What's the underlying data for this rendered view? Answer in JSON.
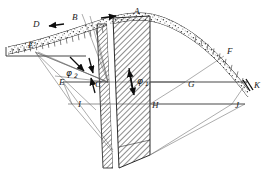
{
  "figure": {
    "background_color": "#ffffff",
    "line_color": "#4a4a4a",
    "dark_line_color": "#1a1a1a",
    "hatch_color": "#3a3a3a",
    "width": 267,
    "height": 185
  },
  "labels": [
    {
      "id": "D",
      "text": "D",
      "x": 33,
      "y": 27,
      "kind": "point"
    },
    {
      "id": "B",
      "text": "B",
      "x": 72,
      "y": 20,
      "kind": "point"
    },
    {
      "id": "A",
      "text": "A",
      "x": 134,
      "y": 14,
      "kind": "point"
    },
    {
      "id": "F",
      "text": "F",
      "x": 227,
      "y": 54,
      "kind": "point"
    },
    {
      "id": "K",
      "text": "K",
      "x": 254,
      "y": 88,
      "kind": "point"
    },
    {
      "id": "Ep",
      "text": "E'",
      "x": 28,
      "y": 48,
      "kind": "point"
    },
    {
      "id": "E",
      "text": "E",
      "x": 59,
      "y": 85,
      "kind": "point"
    },
    {
      "id": "C",
      "text": "C",
      "x": 95,
      "y": 87,
      "kind": "point"
    },
    {
      "id": "G",
      "text": "G",
      "x": 188,
      "y": 87,
      "kind": "point"
    },
    {
      "id": "I",
      "text": "I",
      "x": 78,
      "y": 107,
      "kind": "point"
    },
    {
      "id": "H",
      "text": "H",
      "x": 152,
      "y": 108,
      "kind": "point"
    },
    {
      "id": "J",
      "text": "J",
      "x": 235,
      "y": 108,
      "kind": "point"
    }
  ],
  "angles": [
    {
      "id": "phi2",
      "symbol": "φ",
      "subscript": "2",
      "x": 71,
      "y": 73,
      "vertex": "C"
    },
    {
      "id": "phi1",
      "symbol": "φ",
      "subscript": "1",
      "x": 139,
      "y": 81,
      "vertex": "block-right"
    }
  ],
  "arrows": [
    {
      "id": "arrow-top-left",
      "direction": "left",
      "x1": 64,
      "y1": 24,
      "x2": 47,
      "y2": 26
    },
    {
      "id": "arrow-top-right",
      "direction": "right",
      "x1": 100,
      "y1": 18,
      "x2": 117,
      "y2": 16
    },
    {
      "id": "arrow-band-down",
      "direction": "down-right",
      "x1": 68,
      "y1": 56,
      "x2": 84,
      "y2": 71
    },
    {
      "id": "arrow-shear-left",
      "direction": "down",
      "x1": 90,
      "y1": 57,
      "x2": 94,
      "y2": 72
    },
    {
      "id": "arrow-shear-up",
      "direction": "up",
      "x1": 94,
      "y1": 92,
      "x2": 90,
      "y2": 77
    },
    {
      "id": "arrow-shear-right",
      "direction": "down",
      "x1": 130,
      "y1": 68,
      "x2": 134,
      "y2": 94
    }
  ],
  "features": {
    "arch_band_label": "stratified arch band",
    "fault_block_label": "hatched fault block",
    "fissure_label": "vertical fissure",
    "baseline_label": "ground baseline"
  }
}
